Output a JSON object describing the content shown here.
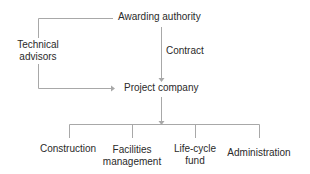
{
  "diagram": {
    "type": "organizational-structure",
    "line_color": "#a8a8a8",
    "text_color": "#2a2a2a",
    "nodes": {
      "awarding_authority": "Awarding authority",
      "technical_advisors_line1": "Technical",
      "technical_advisors_line2": "advisors",
      "project_company": "Project company"
    },
    "edges": {
      "contract_label": "Contract"
    },
    "children": [
      {
        "line1": "Construction",
        "line2": ""
      },
      {
        "line1": "Facilities",
        "line2": "management"
      },
      {
        "line1": "Life-cycle",
        "line2": "fund"
      },
      {
        "line1": "Administration",
        "line2": ""
      }
    ]
  }
}
